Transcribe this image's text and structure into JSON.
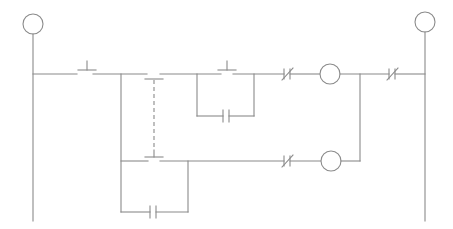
{
  "diagram": {
    "type": "ladder-logic",
    "colors": {
      "line": "#8a8a8a",
      "background": "#ffffff"
    },
    "rails": {
      "left": {
        "x": 33,
        "top_terminal": "circle"
      },
      "right": {
        "x": 425,
        "top_terminal": "circle"
      }
    },
    "rungs": [
      {
        "id": "rung-1",
        "elements": [
          "normally-open-contact",
          "normally-open-contact (mechanically linked, dashed)",
          "normally-open-contact with parallel normally-open branch",
          "normally-closed-contact",
          "coil",
          "normally-closed-contact"
        ]
      },
      {
        "id": "rung-2",
        "elements": [
          "normally-open-contact (mechanically linked, dashed) with parallel normally-open branch",
          "normally-closed-contact",
          "coil"
        ]
      }
    ],
    "labels": []
  }
}
